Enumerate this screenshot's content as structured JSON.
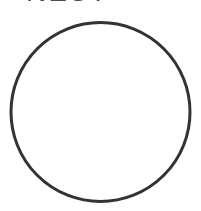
{
  "heading": {
    "text": "NEST",
    "visible": "partially clipped at top edge"
  },
  "shape": {
    "type": "circle",
    "cx": 100.5,
    "cy": 112,
    "r": 89.5,
    "stroke_width": 3,
    "stroke_color": "#333333",
    "fill_color": "#ffffff"
  },
  "background_color": "#ffffff"
}
